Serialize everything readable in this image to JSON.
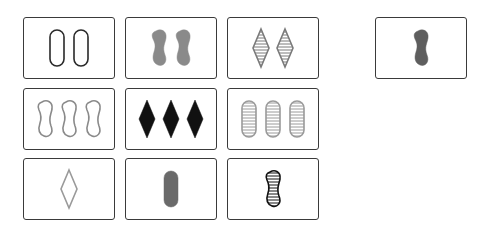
{
  "board": {
    "cards": [
      {
        "id": 1,
        "count": 2,
        "shape": "oval",
        "fill": "empty",
        "color": "#2a2a2a"
      },
      {
        "id": 2,
        "count": 2,
        "shape": "squiggle",
        "fill": "solid",
        "color": "#8a8a8a"
      },
      {
        "id": 3,
        "count": 2,
        "shape": "diamond",
        "fill": "striped",
        "color": "#7a7a7a"
      },
      {
        "id": 4,
        "count": 3,
        "shape": "squiggle",
        "fill": "empty",
        "color": "#8a8a8a"
      },
      {
        "id": 5,
        "count": 3,
        "shape": "diamond",
        "fill": "solid",
        "color": "#111111"
      },
      {
        "id": 6,
        "count": 3,
        "shape": "oval",
        "fill": "striped",
        "color": "#9a9a9a"
      },
      {
        "id": 7,
        "count": 1,
        "shape": "diamond",
        "fill": "empty",
        "color": "#9a9a9a"
      },
      {
        "id": 8,
        "count": 1,
        "shape": "oval",
        "fill": "solid",
        "color": "#6a6a6a"
      },
      {
        "id": 9,
        "count": 1,
        "shape": "squiggle",
        "fill": "striped",
        "color": "#111111"
      }
    ]
  },
  "answer_card": {
    "count": 1,
    "shape": "squiggle",
    "fill": "solid",
    "color": "#5e5e5e"
  }
}
